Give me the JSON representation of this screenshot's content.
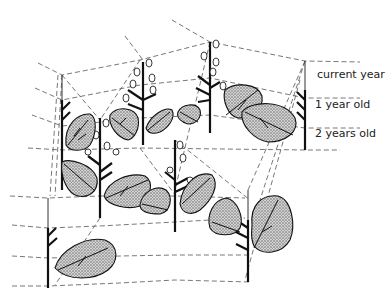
{
  "diagram": {
    "type": "botanical age-structure illustration",
    "labels": {
      "current_year": "current year",
      "one_year_old": "1 year old",
      "two_years_old": "2 years old"
    },
    "colors": {
      "ink": "#111111",
      "dash": "#555555",
      "leaf_fill": "#b8b8b8",
      "background": "#ffffff"
    }
  }
}
